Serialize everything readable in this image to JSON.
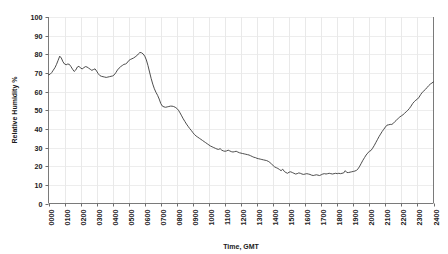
{
  "chart_data": {
    "type": "line",
    "title": "",
    "xlabel": "Time, GMT",
    "ylabel": "Relative Humidity %",
    "ylim": [
      0,
      100
    ],
    "xlim": [
      0,
      24
    ],
    "ytick_labels": [
      "0",
      "10",
      "20",
      "30",
      "40",
      "50",
      "60",
      "70",
      "80",
      "90",
      "100"
    ],
    "ytick_values": [
      0,
      10,
      20,
      30,
      40,
      50,
      60,
      70,
      80,
      90,
      100
    ],
    "xtick_labels": [
      "0000",
      "0100",
      "0200",
      "0300",
      "0400",
      "0500",
      "0600",
      "0700",
      "0800",
      "0900",
      "1000",
      "1100",
      "1200",
      "1300",
      "1400",
      "1500",
      "1600",
      "1700",
      "1800",
      "1900",
      "2000",
      "2100",
      "2200",
      "2300",
      "2400"
    ],
    "xtick_values": [
      0,
      1,
      2,
      3,
      4,
      5,
      6,
      7,
      8,
      9,
      10,
      11,
      12,
      13,
      14,
      15,
      16,
      17,
      18,
      19,
      20,
      21,
      22,
      23,
      24
    ],
    "grid": {
      "vertical": true,
      "horizontal": true
    },
    "legend": {
      "visible": false,
      "position": "none"
    },
    "series": [
      {
        "name": "Relative Humidity",
        "color": "#3a3a3a",
        "x": [
          0.0,
          0.1,
          0.2,
          0.3,
          0.4,
          0.5,
          0.6,
          0.7,
          0.8,
          0.9,
          1.0,
          1.1,
          1.2,
          1.3,
          1.4,
          1.5,
          1.6,
          1.7,
          1.8,
          1.9,
          2.0,
          2.1,
          2.2,
          2.3,
          2.4,
          2.5,
          2.6,
          2.7,
          2.8,
          2.9,
          3.0,
          3.1,
          3.2,
          3.3,
          3.4,
          3.5,
          3.6,
          3.7,
          3.8,
          3.9,
          4.0,
          4.1,
          4.2,
          4.3,
          4.4,
          4.5,
          4.6,
          4.7,
          4.8,
          4.9,
          5.0,
          5.1,
          5.2,
          5.3,
          5.4,
          5.5,
          5.6,
          5.7,
          5.8,
          5.9,
          6.0,
          6.1,
          6.2,
          6.3,
          6.4,
          6.5,
          6.6,
          6.7,
          6.8,
          6.9,
          7.0,
          7.1,
          7.2,
          7.3,
          7.4,
          7.5,
          7.6,
          7.7,
          7.8,
          7.9,
          8.0,
          8.1,
          8.2,
          8.3,
          8.4,
          8.5,
          8.6,
          8.7,
          8.8,
          8.9,
          9.0,
          9.1,
          9.2,
          9.3,
          9.4,
          9.5,
          9.6,
          9.7,
          9.8,
          9.9,
          10.0,
          10.1,
          10.2,
          10.3,
          10.4,
          10.5,
          10.6,
          10.7,
          10.8,
          10.9,
          11.0,
          11.1,
          11.2,
          11.3,
          11.4,
          11.5,
          11.6,
          11.7,
          11.8,
          11.9,
          12.0,
          12.1,
          12.2,
          12.3,
          12.4,
          12.5,
          12.6,
          12.7,
          12.8,
          12.9,
          13.0,
          13.1,
          13.2,
          13.3,
          13.4,
          13.5,
          13.6,
          13.7,
          13.8,
          13.9,
          14.0,
          14.1,
          14.2,
          14.3,
          14.4,
          14.5,
          14.6,
          14.7,
          14.8,
          14.9,
          15.0,
          15.1,
          15.2,
          15.3,
          15.4,
          15.5,
          15.6,
          15.7,
          15.8,
          15.9,
          16.0,
          16.1,
          16.2,
          16.3,
          16.4,
          16.5,
          16.6,
          16.7,
          16.8,
          16.9,
          17.0,
          17.1,
          17.2,
          17.3,
          17.4,
          17.5,
          17.6,
          17.7,
          17.8,
          17.9,
          18.0,
          18.1,
          18.2,
          18.3,
          18.4,
          18.5,
          18.6,
          18.7,
          18.8,
          18.9,
          19.0,
          19.1,
          19.2,
          19.3,
          19.4,
          19.5,
          19.6,
          19.7,
          19.8,
          19.9,
          20.0,
          20.1,
          20.2,
          20.3,
          20.4,
          20.5,
          20.6,
          20.7,
          20.8,
          20.9,
          21.0,
          21.1,
          21.2,
          21.3,
          21.4,
          21.5,
          21.6,
          21.7,
          21.8,
          21.9,
          22.0,
          22.1,
          22.2,
          22.3,
          22.4,
          22.5,
          22.6,
          22.7,
          22.8,
          22.9,
          23.0,
          23.1,
          23.2,
          23.3,
          23.4,
          23.5,
          23.6,
          23.7,
          23.8,
          23.9,
          24.0
        ],
        "y": [
          69.0,
          69.3,
          70.2,
          71.5,
          72.8,
          74.6,
          76.8,
          79.0,
          78.0,
          76.0,
          74.8,
          74.4,
          74.8,
          74.6,
          73.4,
          72.0,
          70.8,
          71.6,
          73.2,
          73.6,
          72.6,
          72.2,
          72.8,
          73.4,
          73.2,
          72.6,
          72.0,
          71.4,
          71.8,
          72.2,
          71.0,
          69.6,
          68.6,
          68.2,
          68.0,
          67.8,
          67.6,
          67.8,
          68.0,
          68.2,
          68.4,
          69.0,
          70.2,
          71.6,
          72.6,
          73.4,
          74.0,
          74.6,
          74.8,
          75.4,
          76.6,
          77.2,
          77.6,
          78.0,
          78.6,
          79.2,
          80.2,
          81.0,
          80.8,
          80.2,
          79.0,
          77.0,
          74.0,
          70.5,
          67.0,
          64.0,
          61.5,
          59.6,
          58.0,
          56.0,
          53.6,
          52.2,
          51.8,
          51.6,
          51.8,
          52.0,
          52.2,
          52.2,
          52.0,
          51.6,
          51.0,
          50.0,
          48.6,
          47.0,
          45.4,
          44.0,
          42.6,
          41.4,
          40.2,
          39.2,
          38.0,
          37.0,
          36.2,
          35.6,
          35.0,
          34.4,
          33.8,
          33.2,
          32.6,
          32.0,
          31.4,
          30.8,
          30.4,
          30.0,
          29.6,
          29.2,
          29.0,
          29.4,
          28.6,
          28.2,
          28.0,
          28.2,
          28.6,
          28.2,
          27.8,
          27.6,
          27.8,
          28.0,
          27.6,
          27.2,
          27.0,
          26.8,
          26.6,
          26.4,
          26.2,
          26.0,
          25.6,
          25.2,
          24.8,
          24.6,
          24.2,
          24.0,
          23.8,
          23.6,
          23.4,
          23.2,
          23.0,
          22.6,
          22.0,
          21.2,
          20.4,
          19.6,
          19.2,
          18.8,
          18.2,
          17.6,
          18.4,
          17.2,
          16.6,
          16.2,
          16.8,
          17.0,
          16.6,
          16.2,
          15.8,
          16.0,
          16.4,
          16.2,
          15.8,
          15.6,
          15.8,
          16.0,
          15.8,
          15.6,
          15.2,
          15.0,
          15.2,
          15.4,
          15.2,
          15.0,
          15.4,
          15.8,
          16.0,
          15.8,
          16.0,
          16.2,
          16.0,
          15.8,
          16.0,
          16.2,
          16.0,
          16.2,
          16.0,
          16.2,
          16.4,
          17.6,
          16.6,
          16.6,
          16.8,
          17.0,
          17.2,
          17.4,
          17.8,
          18.6,
          20.0,
          21.6,
          23.2,
          24.6,
          26.0,
          27.0,
          28.0,
          28.4,
          29.6,
          31.0,
          32.6,
          34.2,
          35.8,
          37.2,
          38.6,
          39.8,
          41.0,
          42.0,
          42.2,
          42.4,
          42.4,
          43.0,
          44.0,
          44.8,
          45.6,
          46.4,
          47.0,
          47.6,
          48.4,
          49.2,
          50.0,
          51.0,
          52.2,
          53.6,
          54.6,
          55.4,
          56.0,
          57.0,
          58.4,
          59.6,
          60.4,
          61.2,
          62.2,
          63.2,
          64.0,
          64.6,
          65.2
        ]
      }
    ]
  },
  "axes": {
    "y_title": "Relative Humidity %",
    "x_title": "Time, GMT"
  }
}
